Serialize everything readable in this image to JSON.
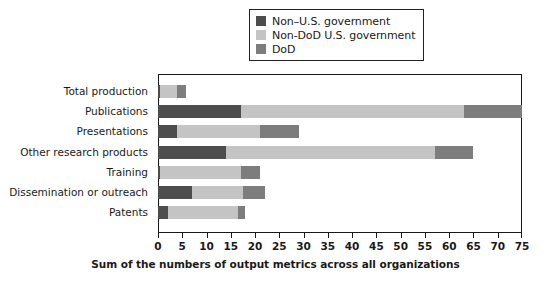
{
  "chart_data": {
    "type": "bar",
    "orientation": "horizontal",
    "stacked": true,
    "title": "",
    "xlabel": "Sum of the numbers of output metrics across all organizations",
    "ylabel": "",
    "xlim": [
      0,
      75
    ],
    "xticks": [
      0,
      5,
      10,
      15,
      20,
      25,
      30,
      35,
      40,
      45,
      50,
      55,
      60,
      65,
      70,
      75
    ],
    "grid": false,
    "legend_position": "top-center",
    "categories": [
      "Total production",
      "Publications",
      "Presentations",
      "Other research products",
      "Training",
      "Dissemination or outreach",
      "Patents"
    ],
    "series": [
      {
        "name": "Non–U.S. government",
        "color": "#4d4d4d",
        "values": [
          0.5,
          17,
          4,
          14,
          0.5,
          7,
          2
        ]
      },
      {
        "name": "Non-DoD U.S. government",
        "color": "#c4c4c4",
        "values": [
          3.5,
          46,
          17,
          43,
          16.5,
          10.5,
          14.5
        ]
      },
      {
        "name": "DoD",
        "color": "#7d7d7d",
        "values": [
          1.7,
          12,
          8,
          8,
          4,
          4.5,
          1.5
        ]
      }
    ],
    "totals": [
      5.7,
      75,
      29,
      65,
      21,
      22,
      18
    ]
  },
  "legend": {
    "items": [
      {
        "label": "Non–U.S. government",
        "color": "#4d4d4d"
      },
      {
        "label": "Non-DoD U.S. government",
        "color": "#c4c4c4"
      },
      {
        "label": "DoD",
        "color": "#7d7d7d"
      }
    ]
  },
  "axis": {
    "x_title": "Sum of the numbers of output metrics across all organizations",
    "x_tick_labels": [
      "0",
      "5",
      "10",
      "15",
      "20",
      "25",
      "30",
      "35",
      "40",
      "45",
      "50",
      "55",
      "60",
      "65",
      "70",
      "75"
    ]
  }
}
